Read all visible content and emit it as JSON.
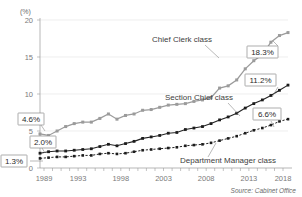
{
  "chart_data": {
    "type": "line",
    "title": "",
    "xlabel": "",
    "ylabel": "",
    "unit_label": "(%)",
    "xlim": [
      1989,
      2018
    ],
    "ylim": [
      0,
      20
    ],
    "yticks": [
      "0",
      "5",
      "10",
      "15",
      "20"
    ],
    "ytick_values": [
      0,
      5,
      10,
      15,
      20
    ],
    "xticks": [
      "1989",
      "1993",
      "1998",
      "2003",
      "2008",
      "2013",
      "2018"
    ],
    "xtick_values": [
      1989,
      1993,
      1998,
      2003,
      2008,
      2013,
      2018
    ],
    "grid": true,
    "legend": "inline-annotations",
    "x": [
      1989,
      1990,
      1991,
      1992,
      1993,
      1994,
      1995,
      1996,
      1997,
      1998,
      1999,
      2000,
      2001,
      2002,
      2003,
      2004,
      2005,
      2006,
      2007,
      2008,
      2009,
      2010,
      2011,
      2012,
      2013,
      2014,
      2015,
      2016,
      2017,
      2018
    ],
    "series": [
      {
        "name": "Chief Clerk class",
        "color": "#9b9b9b",
        "style": "solid",
        "start_value": 4.6,
        "end_value": 18.3,
        "values": [
          4.6,
          4.4,
          5.0,
          5.6,
          6.0,
          6.2,
          6.2,
          6.7,
          7.3,
          6.6,
          7.1,
          7.3,
          7.8,
          7.9,
          8.2,
          8.5,
          8.6,
          8.7,
          9.0,
          9.2,
          9.5,
          10.8,
          11.1,
          11.9,
          13.4,
          14.5,
          15.3,
          17.0,
          17.9,
          18.3
        ]
      },
      {
        "name": "Section Chief class",
        "color": "#1c1c1c",
        "style": "solid",
        "start_value": 2.0,
        "end_value": 11.2,
        "values": [
          2.0,
          2.2,
          2.3,
          2.3,
          2.4,
          2.5,
          2.6,
          2.9,
          3.2,
          3.0,
          3.3,
          3.6,
          4.0,
          4.2,
          4.4,
          4.7,
          4.8,
          5.2,
          5.4,
          5.6,
          6.0,
          6.5,
          6.9,
          7.4,
          8.1,
          8.7,
          9.2,
          9.8,
          10.5,
          11.2
        ]
      },
      {
        "name": "Department Manager class",
        "color": "#1c1c1c",
        "style": "dotted",
        "start_value": 1.3,
        "end_value": 6.6,
        "values": [
          1.3,
          1.4,
          1.5,
          1.5,
          1.6,
          1.7,
          1.7,
          1.9,
          2.0,
          1.9,
          2.0,
          2.2,
          2.4,
          2.5,
          2.6,
          2.7,
          2.8,
          3.0,
          3.1,
          3.2,
          3.4,
          3.7,
          4.0,
          4.3,
          4.7,
          5.1,
          5.4,
          5.8,
          6.3,
          6.6
        ]
      }
    ],
    "annotations": [
      {
        "name": "chief-clerk-start",
        "text": "4.6%",
        "series": "Chief Clerk class",
        "position": "left"
      },
      {
        "name": "section-chief-start",
        "text": "2.0%",
        "series": "Section Chief class",
        "position": "left"
      },
      {
        "name": "dept-manager-start",
        "text": "1.3%",
        "series": "Department Manager class",
        "position": "left"
      },
      {
        "name": "chief-clerk-end",
        "text": "18.3%",
        "series": "Chief Clerk class",
        "position": "right"
      },
      {
        "name": "section-chief-end",
        "text": "11.2%",
        "series": "Section Chief class",
        "position": "right"
      },
      {
        "name": "dept-manager-end",
        "text": "6.6%",
        "series": "Department Manager class",
        "position": "right"
      }
    ],
    "source": "Source: Cabinet Office"
  },
  "labels": {
    "unit": "(%)",
    "chief_clerk": "Chief Clerk class",
    "section_chief": "Section Chief class",
    "dept_manager": "Department Manager class",
    "source": "Source: Cabinet Office",
    "cc_start": "4.6%",
    "sc_start": "2.0%",
    "dm_start": "1.3%",
    "cc_end": "18.3%",
    "sc_end": "11.2%",
    "dm_end": "6.6%",
    "y0": "0",
    "y5": "5",
    "y10": "10",
    "y15": "15",
    "y20": "20",
    "x1989": "1989",
    "x1993": "1993",
    "x1998": "1998",
    "x2003": "2003",
    "x2008": "2008",
    "x2013": "2013",
    "x2018": "2018"
  }
}
